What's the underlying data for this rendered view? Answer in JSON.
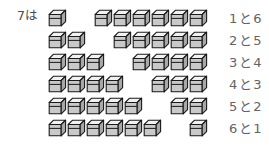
{
  "figure": {
    "lead_label": "7は",
    "cube_colors": {
      "outline": "#1a1a1a",
      "top_face": "#f2f2f2",
      "front_face": "#c9c9c9",
      "side_face": "#a8a8a8"
    },
    "label_color": "#636363",
    "background": "#ffffff"
  },
  "rows": [
    {
      "left_cubes": 1,
      "right_cubes": 6,
      "label": "1と6",
      "left_value": "1",
      "right_value": "6",
      "conjunction": "と"
    },
    {
      "left_cubes": 2,
      "right_cubes": 5,
      "label": "2と5",
      "left_value": "2",
      "right_value": "5",
      "conjunction": "と"
    },
    {
      "left_cubes": 3,
      "right_cubes": 4,
      "label": "3と4",
      "left_value": "3",
      "right_value": "4",
      "conjunction": "と"
    },
    {
      "left_cubes": 4,
      "right_cubes": 3,
      "label": "4と3",
      "left_value": "4",
      "right_value": "3",
      "conjunction": "と"
    },
    {
      "left_cubes": 5,
      "right_cubes": 2,
      "label": "5と2",
      "left_value": "5",
      "right_value": "2",
      "conjunction": "と"
    },
    {
      "left_cubes": 6,
      "right_cubes": 1,
      "label": "6と1",
      "left_value": "6",
      "right_value": "1",
      "conjunction": "と"
    }
  ]
}
